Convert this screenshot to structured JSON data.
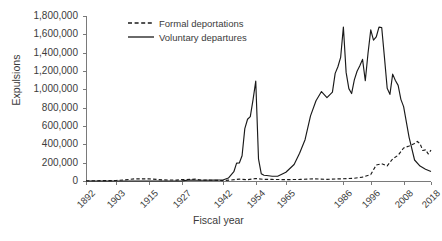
{
  "chart_data": {
    "type": "line",
    "title": "",
    "xlabel": "Fiscal year",
    "ylabel": "Expulsions",
    "ylim": [
      0,
      1800000
    ],
    "ytick_step": 200000,
    "ytick_labels": [
      "1,800,000",
      "1,600,000",
      "1,400,000",
      "1,200,000",
      "1,000,000",
      "800,000",
      "600,000",
      "400,000",
      "200,000",
      "0"
    ],
    "ytick_values": [
      1800000,
      1600000,
      1400000,
      1200000,
      1000000,
      800000,
      600000,
      400000,
      200000,
      0
    ],
    "xlim": [
      1892,
      2018
    ],
    "xtick_labels": [
      "1892",
      "1903",
      "1915",
      "1927",
      "1942",
      "1954",
      "1965",
      "1986",
      "1996",
      "2008",
      "2018"
    ],
    "xtick_values": [
      1892,
      1903,
      1915,
      1927,
      1942,
      1954,
      1965,
      1986,
      1996,
      2008,
      2018
    ],
    "grid": false,
    "legend_position": "top-center",
    "series": [
      {
        "name": "Formal deportations",
        "style": "dashed",
        "color": "#1a1a1a",
        "x": [
          1892,
          1895,
          1900,
          1903,
          1906,
          1910,
          1915,
          1920,
          1925,
          1927,
          1930,
          1932,
          1934,
          1936,
          1939,
          1942,
          1945,
          1948,
          1951,
          1954,
          1957,
          1960,
          1965,
          1970,
          1975,
          1980,
          1986,
          1990,
          1993,
          1996,
          1998,
          2000,
          2002,
          2004,
          2006,
          2008,
          2010,
          2012,
          2013,
          2014,
          2015,
          2016,
          2017,
          2018
        ],
        "y": [
          2800,
          3000,
          4000,
          5500,
          12000,
          24000,
          24000,
          12000,
          10000,
          16000,
          17000,
          20000,
          9000,
          9200,
          8200,
          4500,
          11000,
          20000,
          14000,
          27000,
          18000,
          17000,
          15000,
          17000,
          24000,
          18000,
          25000,
          30000,
          43000,
          70000,
          174000,
          189000,
          165000,
          241000,
          281000,
          360000,
          382000,
          409000,
          432000,
          407000,
          333000,
          340000,
          295000,
          337000
        ]
      },
      {
        "name": "Voluntary departures",
        "style": "solid",
        "color": "#1a1a1a",
        "x": [
          1892,
          1900,
          1910,
          1920,
          1927,
          1930,
          1932,
          1935,
          1939,
          1942,
          1944,
          1946,
          1947,
          1948,
          1949,
          1950,
          1951,
          1952,
          1953,
          1954,
          1955,
          1956,
          1957,
          1958,
          1960,
          1962,
          1965,
          1968,
          1970,
          1972,
          1974,
          1976,
          1978,
          1980,
          1982,
          1983,
          1984,
          1985,
          1986,
          1987,
          1988,
          1989,
          1990,
          1991,
          1992,
          1993,
          1994,
          1995,
          1996,
          1997,
          1998,
          1999,
          2000,
          2001,
          2002,
          2003,
          2004,
          2005,
          2006,
          2007,
          2008,
          2010,
          2012,
          2014,
          2016,
          2018
        ],
        "y": [
          0,
          0,
          0,
          0,
          2000,
          11000,
          9000,
          8000,
          9000,
          11000,
          32000,
          101000,
          195000,
          197000,
          276000,
          572000,
          674000,
          703000,
          885000,
          1089000,
          242000,
          80000,
          63000,
          60000,
          52000,
          52000,
          95000,
          180000,
          303000,
          451000,
          710000,
          875000,
          976000,
          910000,
          970000,
          1174000,
          1246000,
          1348000,
          1679000,
          1185000,
          1008000,
          954000,
          1103000,
          1197000,
          1258000,
          1327000,
          1094000,
          1394000,
          1649000,
          1536000,
          1571000,
          1679000,
          1675000,
          1349000,
          1012000,
          945000,
          1166000,
          1096000,
          1043000,
          891000,
          811000,
          476000,
          229000,
          163000,
          129000,
          104000
        ]
      }
    ]
  },
  "legend": {
    "items": [
      {
        "label": "Formal deportations",
        "style": "dashed"
      },
      {
        "label": "Voluntary departures",
        "style": "solid"
      }
    ]
  }
}
